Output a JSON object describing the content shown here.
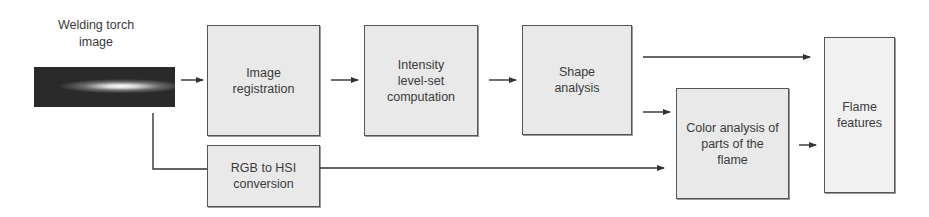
{
  "diagram": {
    "source": {
      "label": "Welding torch image",
      "line1": "Welding torch",
      "line2": "image"
    },
    "nodes": [
      {
        "id": "image_registration",
        "lines": [
          "Image",
          "registration"
        ]
      },
      {
        "id": "intensity",
        "lines": [
          "Intensity",
          "level-set",
          "computation"
        ]
      },
      {
        "id": "shape_analysis",
        "lines": [
          "Shape",
          "analysis"
        ]
      },
      {
        "id": "rgb_to_hsi",
        "lines": [
          "RGB to HSI",
          "conversion"
        ]
      },
      {
        "id": "color_analysis",
        "lines": [
          "Color analysis of",
          "parts of the",
          "flame"
        ]
      },
      {
        "id": "flame_features",
        "lines": [
          "Flame",
          "features"
        ]
      }
    ],
    "edges": [
      {
        "from": "welding_torch_image",
        "to": "image_registration"
      },
      {
        "from": "welding_torch_image",
        "to": "rgb_to_hsi"
      },
      {
        "from": "image_registration",
        "to": "intensity"
      },
      {
        "from": "intensity",
        "to": "shape_analysis"
      },
      {
        "from": "shape_analysis",
        "to": "flame_features"
      },
      {
        "from": "shape_analysis",
        "to": "color_analysis"
      },
      {
        "from": "rgb_to_hsi",
        "to": "color_analysis"
      },
      {
        "from": "color_analysis",
        "to": "flame_features"
      }
    ],
    "colors": {
      "box_fill": "#e9e9e9",
      "box_border": "#555555",
      "line": "#333333",
      "text": "#3a3a3a"
    }
  }
}
